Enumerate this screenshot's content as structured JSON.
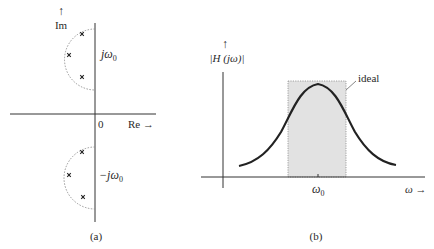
{
  "panel_a": {
    "caption": "(a)",
    "y_axis_arrow": "↑",
    "y_axis_label": "Im",
    "x_axis_label": "Re →",
    "origin_label": "0",
    "upper_label_prefix": "jω",
    "upper_label_sub": "0",
    "lower_label_prefix": "−jω",
    "lower_label_sub": "0",
    "pole_marker": "×",
    "upper_poles": [
      [
        82,
        34
      ],
      [
        69,
        54
      ],
      [
        82,
        77
      ]
    ],
    "lower_poles": [
      [
        82,
        152
      ],
      [
        69,
        175
      ],
      [
        83,
        197
      ]
    ]
  },
  "panel_b": {
    "caption": "(b)",
    "y_axis_arrow": "↑",
    "y_axis_label": "|H (jω)|",
    "x_axis_label": "ω →",
    "center_tick_prefix": "ω",
    "center_tick_sub": "0",
    "ideal_label": "ideal",
    "colors": {
      "band_fill": "#e2e2e2",
      "curve": "#222222"
    }
  }
}
